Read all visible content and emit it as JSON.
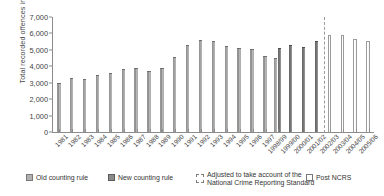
{
  "chart_data": {
    "type": "bar",
    "title": "",
    "xlabel": "",
    "ylabel": "Total recorded offences in 000s",
    "ylim": [
      0,
      7000
    ],
    "ytick_labels": [
      "0",
      "1,000",
      "2,000",
      "3,000",
      "4,000",
      "5,000",
      "6,000",
      "7,000"
    ],
    "ytick_values": [
      0,
      1000,
      2000,
      3000,
      4000,
      5000,
      6000,
      7000
    ],
    "grid": false,
    "legend_position": "below",
    "categories": [
      "1981",
      "1982",
      "1983",
      "1984",
      "1985",
      "1986",
      "1987",
      "1988",
      "1989",
      "1990",
      "1991",
      "1992",
      "1993",
      "1994",
      "1995",
      "1996",
      "1997",
      "1998/99",
      "1999/00",
      "2000/01",
      "2001/02",
      "2002/03",
      "2003/04",
      "2004/05",
      "2005/06"
    ],
    "series": [
      {
        "name": "Old counting rule",
        "style": "old",
        "values": [
          2963,
          3262,
          3247,
          3499,
          3612,
          3847,
          3892,
          3716,
          3871,
          4544,
          5276,
          5591,
          5526,
          5253,
          5100,
          5037,
          4598,
          4482,
          null,
          null,
          null,
          null,
          null,
          null,
          null
        ]
      },
      {
        "name": "New counting rule",
        "style": "new",
        "values": [
          null,
          null,
          null,
          null,
          null,
          null,
          null,
          null,
          null,
          null,
          null,
          null,
          null,
          null,
          null,
          null,
          null,
          5109,
          5301,
          5171,
          5527,
          null,
          null,
          null,
          null
        ]
      },
      {
        "name": "Post NCRS",
        "style": "post",
        "values": [
          null,
          null,
          null,
          null,
          null,
          null,
          null,
          null,
          null,
          null,
          null,
          null,
          null,
          null,
          null,
          null,
          null,
          null,
          null,
          null,
          null,
          5899,
          5935,
          5638,
          5556
        ]
      }
    ],
    "annotations": [
      {
        "type": "vertical-dashed-line",
        "label": "Adjusted to take account of the National Crime Reporting Standard",
        "at_category": "2002/03"
      }
    ],
    "legend": [
      {
        "label": "Old counting rule",
        "swatch": "old",
        "color": "#b0b0b0"
      },
      {
        "label": "New counting rule",
        "swatch": "new",
        "color": "#8a8a8a"
      },
      {
        "label": "Adjusted to take account of the National Crime Reporting Standard",
        "label_line_1": "Adjusted to take account of the",
        "label_line_2": "National Crime Reporting Standard",
        "swatch": "dashed",
        "color": "#7d7d7d"
      },
      {
        "label": "Post NCRS",
        "swatch": "post",
        "color": "#ffffff"
      }
    ]
  }
}
